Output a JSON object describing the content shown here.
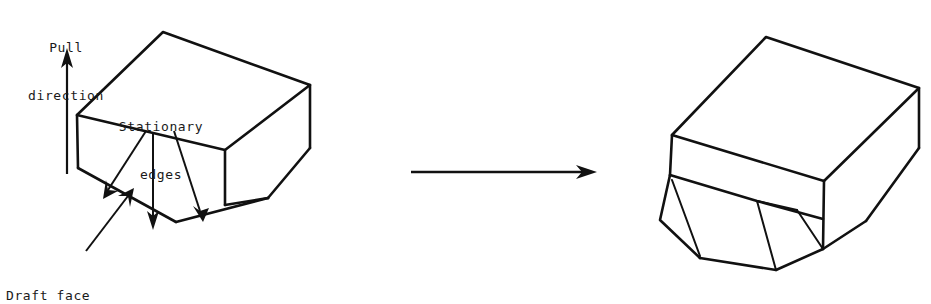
{
  "figure": {
    "kind": "engineering-line-drawing",
    "background_color": "#ffffff",
    "line_color": "#111111"
  },
  "labels": {
    "pull_direction": {
      "line1": "Pull",
      "line2": "direction"
    },
    "stationary_edges": {
      "line1": "Stationary",
      "line2": "edges"
    },
    "draft_face": {
      "line1": "Draft face"
    }
  },
  "annotations": {
    "pull_arrow": "pull-direction-arrow",
    "transform_arrow": "transformation-arrow",
    "leader_count": 4
  },
  "shapes": {
    "left_block": "block-before-draft",
    "right_block": "block-after-draft"
  }
}
